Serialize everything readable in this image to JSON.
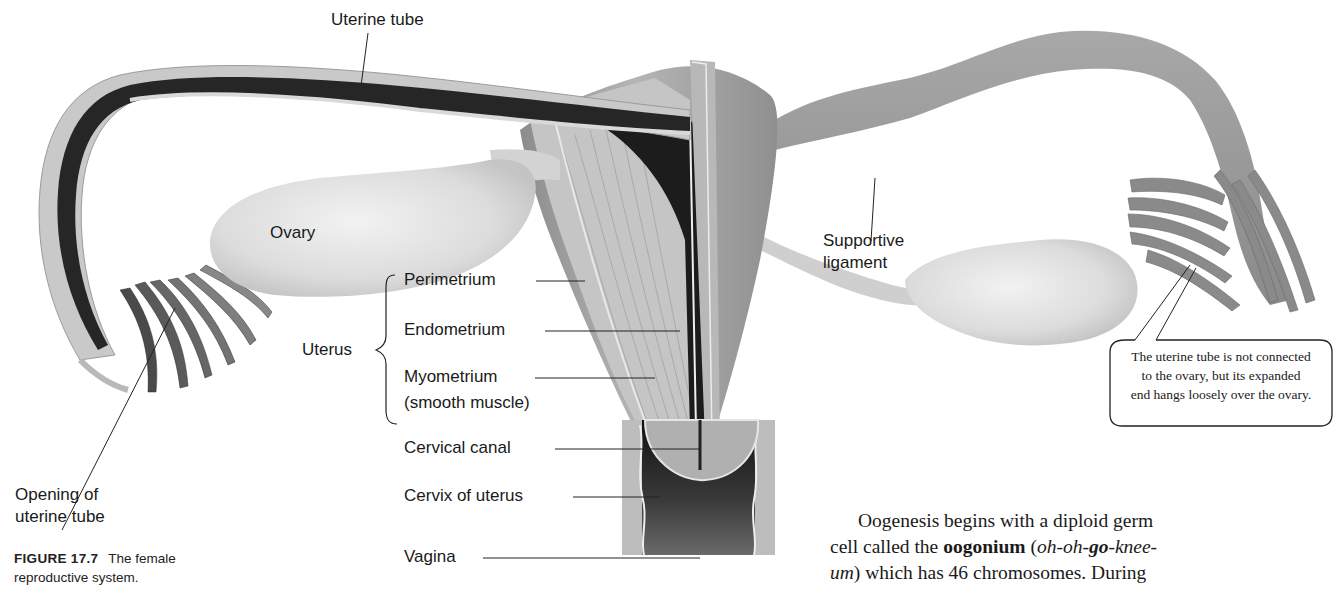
{
  "figure": {
    "number": "FIGURE 17.7",
    "caption": "The female reproductive system.",
    "caption_line1": "The female",
    "caption_line2": "reproductive system."
  },
  "labels": {
    "uterine_tube": "Uterine tube",
    "ovary": "Ovary",
    "opening_line1": "Opening of",
    "opening_line2": "uterine tube",
    "uterus": "Uterus",
    "perimetrium": "Perimetrium",
    "endometrium": "Endometrium",
    "myometrium_line1": "Myometrium",
    "myometrium_line2": "(smooth muscle)",
    "cervical_canal": "Cervical canal",
    "cervix": "Cervix of uterus",
    "vagina": "Vagina",
    "supportive_line1": "Supportive",
    "supportive_line2": "ligament"
  },
  "callout": {
    "line1": "The uterine tube is not connected",
    "line2": "to the ovary, but its expanded",
    "line3": "end hangs loosely over the ovary."
  },
  "body_text": {
    "line1": "Oogenesis begins with a diploid germ",
    "line2_pre": "cell called the ",
    "line2_bold": "oogonium",
    "line2_post": " (",
    "line2_italic_a": "oh-oh-",
    "line2_bold_italic": "go",
    "line2_italic_b": "-knee-",
    "line3_italic": "um",
    "line3_post": ") which has 46 chromosomes. During"
  },
  "colors": {
    "tissue_light": "#c8c8c8",
    "tissue_mid": "#9a9a9a",
    "tissue_dark": "#2a2a2a",
    "ovary": "#e4e4e4",
    "text": "#1a1a1a"
  }
}
